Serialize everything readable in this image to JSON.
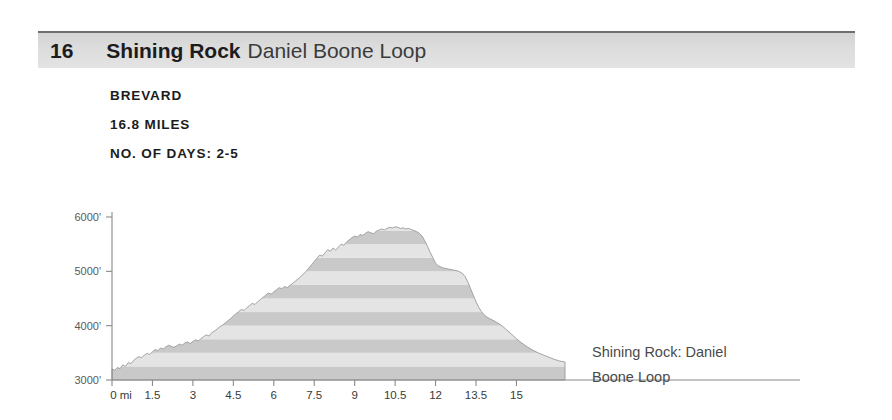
{
  "header": {
    "number": "16",
    "title_bold": "Shining Rock",
    "title_light": "Daniel Boone Loop"
  },
  "meta": {
    "location": "BREVARD",
    "distance": "16.8 MILES",
    "days": "NO. OF DAYS: 2-5"
  },
  "caption": {
    "line1": "Shining Rock: Daniel",
    "line2": "Boone Loop"
  },
  "colors": {
    "header_bar": "#dcdcdc",
    "header_rule": "#6e6e6e",
    "text_dark": "#1c1c1c",
    "text_muted": "#4a4a4a",
    "axis": "#8a8a8a",
    "band_light": "#e4e4e4",
    "band_dark": "#c9c9c9"
  },
  "chart_data": {
    "type": "area",
    "title": "Shining Rock: Daniel Boone Loop",
    "xlabel": "miles",
    "ylabel": "elevation (feet)",
    "xlim": [
      0,
      16.8
    ],
    "ylim": [
      3000,
      6300
    ],
    "grid": false,
    "legend": false,
    "bands": "horizontal alternating shading every 250 feet",
    "xticks": [
      0,
      1.5,
      3,
      4.5,
      6,
      7.5,
      9,
      10.5,
      12,
      13.5,
      15
    ],
    "xtick_labels": [
      "0 mi",
      "1.5",
      "3",
      "4.5",
      "6",
      "7.5",
      "9",
      "10.5",
      "12",
      "13.5",
      "15"
    ],
    "yticks": [
      3000,
      4000,
      5000,
      6000
    ],
    "ytick_labels": [
      "3000'",
      "4000'",
      "5000'",
      "6000'"
    ],
    "x": [
      0.0,
      0.1,
      0.2,
      0.3,
      0.4,
      0.5,
      0.6,
      0.7,
      0.8,
      0.9,
      1.0,
      1.1,
      1.2,
      1.3,
      1.4,
      1.5,
      1.6,
      1.7,
      1.8,
      1.9,
      2.0,
      2.1,
      2.2,
      2.3,
      2.4,
      2.5,
      2.6,
      2.7,
      2.8,
      2.9,
      3.0,
      3.1,
      3.2,
      3.3,
      3.4,
      3.5,
      3.6,
      3.7,
      3.8,
      3.9,
      4.0,
      4.1,
      4.2,
      4.3,
      4.4,
      4.5,
      4.6,
      4.7,
      4.8,
      4.9,
      5.0,
      5.1,
      5.2,
      5.3,
      5.4,
      5.5,
      5.6,
      5.7,
      5.8,
      5.9,
      6.0,
      6.1,
      6.2,
      6.3,
      6.4,
      6.5,
      6.6,
      6.7,
      6.8,
      6.9,
      7.0,
      7.1,
      7.2,
      7.3,
      7.4,
      7.5,
      7.6,
      7.7,
      7.8,
      7.9,
      8.0,
      8.1,
      8.2,
      8.3,
      8.4,
      8.5,
      8.6,
      8.7,
      8.8,
      8.9,
      9.0,
      9.1,
      9.2,
      9.3,
      9.4,
      9.5,
      9.6,
      9.7,
      9.8,
      9.9,
      10.0,
      10.1,
      10.2,
      10.3,
      10.4,
      10.5,
      10.6,
      10.7,
      10.8,
      10.9,
      11.0,
      11.1,
      11.2,
      11.3,
      11.4,
      11.5,
      11.6,
      11.7,
      11.8,
      11.9,
      12.0,
      12.1,
      12.2,
      12.3,
      12.4,
      12.5,
      12.6,
      12.7,
      12.8,
      12.9,
      13.0,
      13.1,
      13.2,
      13.3,
      13.4,
      13.5,
      13.6,
      13.7,
      13.8,
      13.9,
      14.0,
      14.2,
      14.4,
      14.6,
      14.8,
      15.0,
      15.2,
      15.4,
      15.6,
      15.8,
      16.0,
      16.2,
      16.4,
      16.6,
      16.8
    ],
    "y": [
      3200,
      3180,
      3230,
      3210,
      3280,
      3250,
      3320,
      3300,
      3360,
      3400,
      3430,
      3410,
      3460,
      3490,
      3470,
      3520,
      3560,
      3540,
      3590,
      3570,
      3610,
      3640,
      3620,
      3600,
      3630,
      3660,
      3640,
      3680,
      3700,
      3670,
      3710,
      3740,
      3720,
      3760,
      3800,
      3830,
      3810,
      3870,
      3900,
      3940,
      3980,
      4010,
      4050,
      4090,
      4130,
      4180,
      4220,
      4260,
      4300,
      4280,
      4330,
      4370,
      4410,
      4390,
      4440,
      4480,
      4520,
      4560,
      4600,
      4580,
      4620,
      4660,
      4700,
      4680,
      4720,
      4700,
      4740,
      4780,
      4820,
      4860,
      4900,
      4950,
      5000,
      5060,
      5120,
      5180,
      5240,
      5300,
      5280,
      5340,
      5400,
      5370,
      5430,
      5390,
      5450,
      5500,
      5480,
      5540,
      5580,
      5620,
      5650,
      5630,
      5680,
      5660,
      5700,
      5730,
      5710,
      5690,
      5740,
      5760,
      5780,
      5760,
      5790,
      5810,
      5800,
      5820,
      5810,
      5790,
      5800,
      5780,
      5790,
      5770,
      5750,
      5730,
      5700,
      5650,
      5560,
      5460,
      5350,
      5250,
      5150,
      5100,
      5080,
      5060,
      5050,
      5040,
      5030,
      5020,
      5010,
      4990,
      4960,
      4900,
      4800,
      4680,
      4560,
      4440,
      4340,
      4260,
      4200,
      4160,
      4130,
      4080,
      4020,
      3940,
      3850,
      3760,
      3680,
      3610,
      3550,
      3500,
      3460,
      3420,
      3380,
      3350,
      3330
    ]
  }
}
